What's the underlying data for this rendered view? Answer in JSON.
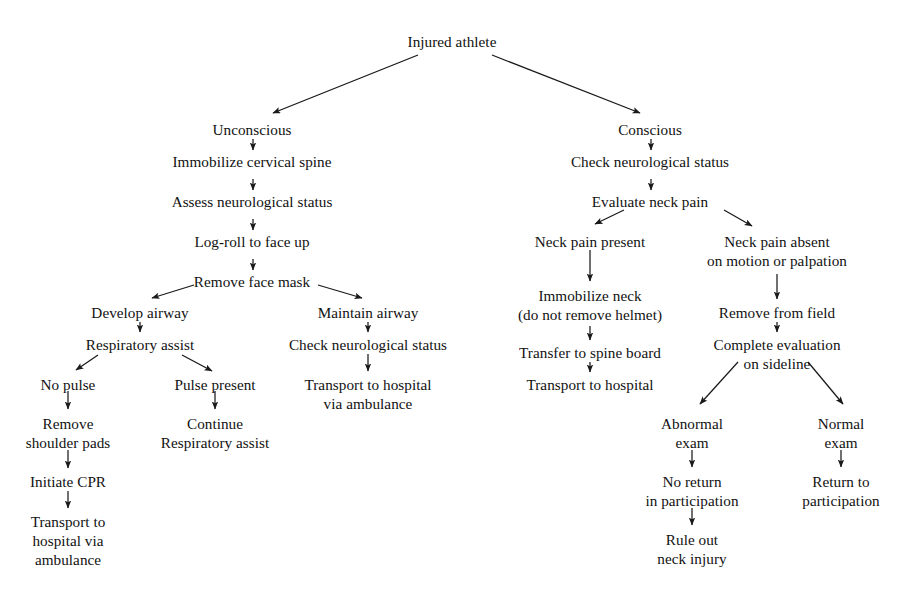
{
  "figure": {
    "type": "flowchart",
    "background_color": "#ffffff",
    "text_color": "#111111",
    "edge_color": "#1a1a1a",
    "scan_artifact_text": "partial cut-off line"
  },
  "nodes": [
    {
      "id": "injured-athlete",
      "x": 452,
      "y": 32,
      "lines": [
        "Injured athlete"
      ]
    },
    {
      "id": "unconscious",
      "x": 252,
      "y": 120,
      "lines": [
        "Unconscious"
      ]
    },
    {
      "id": "immobilize-cervical-spine",
      "x": 252,
      "y": 152,
      "lines": [
        "Immobilize cervical spine"
      ]
    },
    {
      "id": "assess-neurological-status",
      "x": 252,
      "y": 192,
      "lines": [
        "Assess neurological status"
      ]
    },
    {
      "id": "log-roll-to-face-up",
      "x": 252,
      "y": 232,
      "lines": [
        "Log-roll to face up"
      ]
    },
    {
      "id": "remove-face-mask",
      "x": 252,
      "y": 272,
      "lines": [
        "Remove face mask"
      ]
    },
    {
      "id": "develop-airway",
      "x": 140,
      "y": 303,
      "lines": [
        "Develop airway"
      ]
    },
    {
      "id": "respiratory-assist",
      "x": 140,
      "y": 335,
      "lines": [
        "Respiratory assist"
      ]
    },
    {
      "id": "no-pulse",
      "x": 68,
      "y": 375,
      "lines": [
        "No pulse"
      ]
    },
    {
      "id": "remove-shoulder-pads",
      "x": 68,
      "y": 414,
      "lines": [
        "Remove",
        "shoulder pads"
      ]
    },
    {
      "id": "initiate-cpr",
      "x": 68,
      "y": 472,
      "lines": [
        "Initiate CPR"
      ]
    },
    {
      "id": "transport-hospital-ambulance-left",
      "x": 68,
      "y": 512,
      "lines": [
        "Transport to",
        "hospital via",
        "ambulance"
      ]
    },
    {
      "id": "pulse-present",
      "x": 215,
      "y": 375,
      "lines": [
        "Pulse present"
      ]
    },
    {
      "id": "continue-respiratory-assist",
      "x": 215,
      "y": 414,
      "lines": [
        "Continue",
        "Respiratory assist"
      ]
    },
    {
      "id": "maintain-airway",
      "x": 368,
      "y": 303,
      "lines": [
        "Maintain airway"
      ]
    },
    {
      "id": "check-neurological-status-left",
      "x": 368,
      "y": 335,
      "lines": [
        "Check neurological status"
      ]
    },
    {
      "id": "transport-hospital-via-ambulance-mid",
      "x": 368,
      "y": 375,
      "lines": [
        "Transport to hospital",
        "via ambulance"
      ]
    },
    {
      "id": "conscious",
      "x": 650,
      "y": 120,
      "lines": [
        "Conscious"
      ]
    },
    {
      "id": "check-neurological-status-right",
      "x": 650,
      "y": 152,
      "lines": [
        "Check neurological status"
      ]
    },
    {
      "id": "evaluate-neck-pain",
      "x": 650,
      "y": 192,
      "lines": [
        "Evaluate neck pain"
      ]
    },
    {
      "id": "neck-pain-present",
      "x": 590,
      "y": 232,
      "lines": [
        "Neck pain present"
      ]
    },
    {
      "id": "immobilize-neck",
      "x": 590,
      "y": 286,
      "lines": [
        "Immobilize neck",
        "(do not remove helmet)"
      ]
    },
    {
      "id": "transfer-to-spine-board",
      "x": 590,
      "y": 343,
      "lines": [
        "Transfer to spine board"
      ]
    },
    {
      "id": "transport-to-hospital-right",
      "x": 590,
      "y": 375,
      "lines": [
        "Transport to hospital"
      ]
    },
    {
      "id": "neck-pain-absent",
      "x": 777,
      "y": 232,
      "lines": [
        "Neck pain absent",
        "on motion or palpation"
      ]
    },
    {
      "id": "remove-from-field",
      "x": 777,
      "y": 303,
      "lines": [
        "Remove from field"
      ]
    },
    {
      "id": "complete-evaluation",
      "x": 777,
      "y": 335,
      "lines": [
        "Complete evaluation",
        "on sideline"
      ]
    },
    {
      "id": "abnormal-exam",
      "x": 692,
      "y": 414,
      "lines": [
        "Abnormal",
        "exam"
      ]
    },
    {
      "id": "no-return-in-participation",
      "x": 692,
      "y": 472,
      "lines": [
        "No return",
        "in participation"
      ]
    },
    {
      "id": "rule-out-neck-injury",
      "x": 692,
      "y": 530,
      "lines": [
        "Rule out",
        "neck injury"
      ]
    },
    {
      "id": "normal-exam",
      "x": 841,
      "y": 414,
      "lines": [
        "Normal",
        "exam"
      ]
    },
    {
      "id": "return-to-participation",
      "x": 841,
      "y": 472,
      "lines": [
        "Return to",
        "participation"
      ]
    }
  ],
  "edges": [
    {
      "id": "athlete-to-unconscious",
      "from": "injured-athlete",
      "to": "unconscious",
      "x1": 418,
      "y1": 55,
      "x2": 273,
      "y2": 113
    },
    {
      "id": "athlete-to-conscious",
      "from": "injured-athlete",
      "to": "conscious",
      "x1": 492,
      "y1": 55,
      "x2": 640,
      "y2": 113
    },
    {
      "id": "unconscious-to-immobilize",
      "from": "unconscious",
      "to": "immobilize-cervical-spine",
      "x1": 253,
      "y1": 139,
      "x2": 253,
      "y2": 150
    },
    {
      "id": "immobilize-to-assess",
      "from": "immobilize-cervical-spine",
      "to": "assess-neurological-status",
      "x1": 253,
      "y1": 179,
      "x2": 253,
      "y2": 190
    },
    {
      "id": "assess-to-logroll",
      "from": "assess-neurological-status",
      "to": "log-roll-to-face-up",
      "x1": 253,
      "y1": 219,
      "x2": 253,
      "y2": 230
    },
    {
      "id": "logroll-to-removemask",
      "from": "log-roll-to-face-up",
      "to": "remove-face-mask",
      "x1": 253,
      "y1": 259,
      "x2": 253,
      "y2": 270
    },
    {
      "id": "removemask-to-develop",
      "from": "remove-face-mask",
      "to": "develop-airway",
      "x1": 194,
      "y1": 285,
      "x2": 152,
      "y2": 298
    },
    {
      "id": "removemask-to-maintain",
      "from": "remove-face-mask",
      "to": "maintain-airway",
      "x1": 318,
      "y1": 285,
      "x2": 362,
      "y2": 298
    },
    {
      "id": "develop-to-respiratory",
      "from": "develop-airway",
      "to": "respiratory-assist",
      "x1": 140,
      "y1": 322,
      "x2": 140,
      "y2": 332
    },
    {
      "id": "respiratory-to-nopulse",
      "from": "respiratory-assist",
      "to": "no-pulse",
      "x1": 98,
      "y1": 355,
      "x2": 76,
      "y2": 370
    },
    {
      "id": "respiratory-to-pulsepresent",
      "from": "respiratory-assist",
      "to": "pulse-present",
      "x1": 182,
      "y1": 355,
      "x2": 212,
      "y2": 371
    },
    {
      "id": "nopulse-to-removepads",
      "from": "no-pulse",
      "to": "remove-shoulder-pads",
      "x1": 68,
      "y1": 391,
      "x2": 68,
      "y2": 409
    },
    {
      "id": "removepads-to-cpr",
      "from": "remove-shoulder-pads",
      "to": "initiate-cpr",
      "x1": 68,
      "y1": 450,
      "x2": 68,
      "y2": 468
    },
    {
      "id": "cpr-to-transport",
      "from": "initiate-cpr",
      "to": "transport-hospital-ambulance-left",
      "x1": 68,
      "y1": 491,
      "x2": 68,
      "y2": 508
    },
    {
      "id": "pulsepresent-to-continue",
      "from": "pulse-present",
      "to": "continue-respiratory-assist",
      "x1": 215,
      "y1": 391,
      "x2": 215,
      "y2": 409
    },
    {
      "id": "maintain-to-check",
      "from": "maintain-airway",
      "to": "check-neurological-status-left",
      "x1": 368,
      "y1": 322,
      "x2": 368,
      "y2": 332
    },
    {
      "id": "check-to-transport-mid",
      "from": "check-neurological-status-left",
      "to": "transport-hospital-via-ambulance-mid",
      "x1": 368,
      "y1": 354,
      "x2": 368,
      "y2": 371
    },
    {
      "id": "conscious-to-check",
      "from": "conscious",
      "to": "check-neurological-status-right",
      "x1": 651,
      "y1": 139,
      "x2": 651,
      "y2": 150
    },
    {
      "id": "check-to-evaluate",
      "from": "check-neurological-status-right",
      "to": "evaluate-neck-pain",
      "x1": 651,
      "y1": 179,
      "x2": 651,
      "y2": 190
    },
    {
      "id": "evaluate-to-painpresent",
      "from": "evaluate-neck-pain",
      "to": "neck-pain-present",
      "x1": 624,
      "y1": 210,
      "x2": 595,
      "y2": 224
    },
    {
      "id": "evaluate-to-painabsent",
      "from": "evaluate-neck-pain",
      "to": "neck-pain-absent",
      "x1": 724,
      "y1": 210,
      "x2": 752,
      "y2": 226
    },
    {
      "id": "painpresent-to-immobilize",
      "from": "neck-pain-present",
      "to": "immobilize-neck",
      "x1": 590,
      "y1": 250,
      "x2": 590,
      "y2": 281
    },
    {
      "id": "immobilizeneck-to-spineboard",
      "from": "immobilize-neck",
      "to": "transfer-to-spine-board",
      "x1": 590,
      "y1": 326,
      "x2": 590,
      "y2": 340
    },
    {
      "id": "spineboard-to-transport",
      "from": "transfer-to-spine-board",
      "to": "transport-to-hospital-right",
      "x1": 590,
      "y1": 362,
      "x2": 590,
      "y2": 372
    },
    {
      "id": "painabsent-to-removefield",
      "from": "neck-pain-absent",
      "to": "remove-from-field",
      "x1": 777,
      "y1": 274,
      "x2": 777,
      "y2": 299
    },
    {
      "id": "removefield-to-complete",
      "from": "remove-from-field",
      "to": "complete-evaluation",
      "x1": 777,
      "y1": 322,
      "x2": 777,
      "y2": 332
    },
    {
      "id": "complete-to-abnormal",
      "from": "complete-evaluation",
      "to": "abnormal-exam",
      "x1": 738,
      "y1": 362,
      "x2": 700,
      "y2": 404
    },
    {
      "id": "complete-to-normal",
      "from": "complete-evaluation",
      "to": "normal-exam",
      "x1": 808,
      "y1": 362,
      "x2": 843,
      "y2": 404
    },
    {
      "id": "abnormal-to-noreturn",
      "from": "abnormal-exam",
      "to": "no-return-in-participation",
      "x1": 692,
      "y1": 450,
      "x2": 692,
      "y2": 467
    },
    {
      "id": "noreturn-to-ruleout",
      "from": "no-return-in-participation",
      "to": "rule-out-neck-injury",
      "x1": 692,
      "y1": 508,
      "x2": 692,
      "y2": 525
    },
    {
      "id": "normal-to-return",
      "from": "normal-exam",
      "to": "return-to-participation",
      "x1": 841,
      "y1": 450,
      "x2": 841,
      "y2": 467
    }
  ]
}
